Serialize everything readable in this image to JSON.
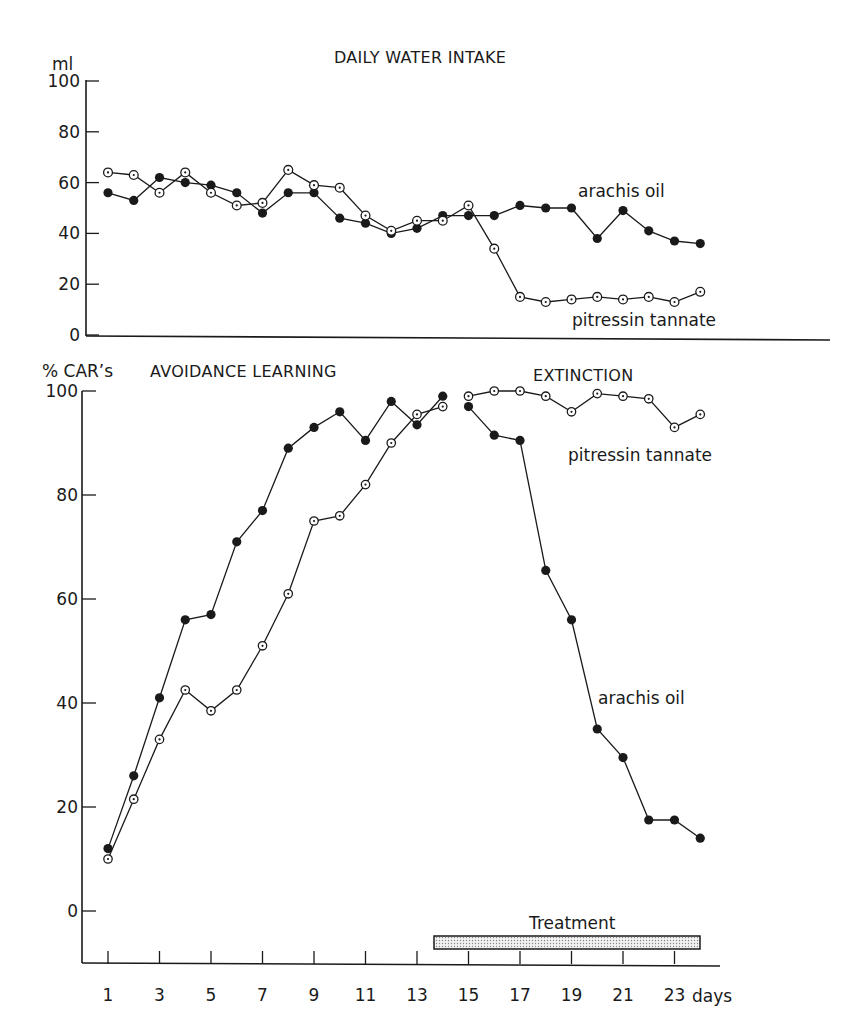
{
  "chart_data": [
    {
      "type": "line",
      "title": "DAILY WATER INTAKE",
      "ylabel": "ml",
      "xlabel": "days",
      "ylim": [
        0,
        100
      ],
      "yticks": [
        0,
        20,
        40,
        60,
        80,
        100
      ],
      "x": [
        1,
        2,
        3,
        4,
        5,
        6,
        7,
        8,
        9,
        10,
        11,
        12,
        13,
        14,
        15,
        16,
        17,
        18,
        19,
        20,
        21,
        22,
        23,
        24
      ],
      "series": [
        {
          "name": "arachis oil",
          "marker": "filled-circle",
          "values": [
            56,
            53,
            62,
            60,
            59,
            56,
            48,
            56,
            56,
            46,
            44,
            40,
            42,
            47,
            47,
            47,
            51,
            50,
            50,
            38,
            49,
            41,
            37,
            36
          ]
        },
        {
          "name": "pitressin tannate",
          "marker": "dotted-circle",
          "values": [
            64,
            63,
            56,
            64,
            56,
            51,
            52,
            65,
            59,
            58,
            47,
            41,
            45,
            45,
            51,
            34,
            15,
            13,
            14,
            15,
            14,
            15,
            13,
            17
          ]
        }
      ],
      "grid": false
    },
    {
      "type": "line",
      "title": "AVOIDANCE LEARNING / EXTINCTION",
      "section_labels": [
        "AVOIDANCE LEARNING",
        "EXTINCTION"
      ],
      "ylabel": "% CAR's",
      "xlabel": "days",
      "ylim": [
        -10,
        100
      ],
      "yticks": [
        0,
        20,
        40,
        60,
        80,
        100
      ],
      "xticks": [
        1,
        3,
        5,
        7,
        9,
        11,
        13,
        15,
        17,
        19,
        21,
        23
      ],
      "x": [
        1,
        2,
        3,
        4,
        5,
        6,
        7,
        8,
        9,
        10,
        11,
        12,
        13,
        14,
        15,
        16,
        17,
        18,
        19,
        20,
        21,
        22,
        23,
        24
      ],
      "series": [
        {
          "name": "arachis oil",
          "marker": "filled-circle",
          "values": [
            12,
            26,
            41,
            56,
            57,
            71,
            77,
            89,
            93,
            96,
            90.5,
            98,
            93.5,
            99,
            97,
            91.5,
            90.5,
            65.5,
            56,
            35,
            29.5,
            17.5,
            17.5,
            14
          ]
        },
        {
          "name": "pitressin tannate",
          "marker": "dotted-circle",
          "values": [
            10,
            21.5,
            33,
            42.5,
            38.5,
            42.5,
            51,
            61,
            75,
            76,
            82,
            90,
            95.5,
            97,
            99,
            100,
            100,
            99,
            96,
            99.5,
            99,
            98.5,
            93,
            95.5
          ]
        }
      ],
      "annotations": [
        {
          "text": "Treatment",
          "x_start": 14,
          "x_end": 24
        }
      ],
      "grid": false
    }
  ],
  "top": {
    "title": "DAILY WATER INTAKE",
    "y_unit": "ml",
    "y_ticks": [
      "100",
      "80",
      "60",
      "40",
      "20",
      "0"
    ],
    "label_arachis": "arachis oil",
    "label_pitressin": "pitressin tannate"
  },
  "bottom": {
    "y_unit": "% CAR’s",
    "title_learning": "AVOIDANCE LEARNING",
    "title_extinction": "EXTINCTION",
    "y_ticks": [
      "100",
      "80",
      "60",
      "40",
      "20",
      "0"
    ],
    "x_ticks": [
      "1",
      "3",
      "5",
      "7",
      "9",
      "11",
      "13",
      "15",
      "17",
      "19",
      "21",
      "23"
    ],
    "x_unit": "days",
    "label_arachis": "arachis oil",
    "label_pitressin": "pitressin tannate",
    "treatment_label": "Treatment"
  },
  "colors": {
    "ink": "#1a1a1a",
    "treatment_fill": "#d9d9d9"
  }
}
